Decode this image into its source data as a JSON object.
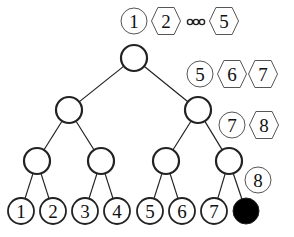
{
  "diagram": {
    "type": "complete-binary-tree",
    "levels": 4,
    "colors": {
      "stroke": "#222222",
      "annotation_stroke": "#555555",
      "filled_leaf": "#000000",
      "background": "#ffffff"
    },
    "tree_nodes": [
      {
        "id": "root",
        "x": 134,
        "y": 58,
        "level": 0
      },
      {
        "id": "l1-left",
        "x": 69,
        "y": 110,
        "level": 1
      },
      {
        "id": "l1-right",
        "x": 198,
        "y": 110,
        "level": 1
      },
      {
        "id": "l2-a",
        "x": 37,
        "y": 161,
        "level": 2
      },
      {
        "id": "l2-b",
        "x": 101,
        "y": 161,
        "level": 2
      },
      {
        "id": "l2-c",
        "x": 166,
        "y": 161,
        "level": 2
      },
      {
        "id": "l2-d",
        "x": 229,
        "y": 161,
        "level": 2
      }
    ],
    "edges": [
      [
        "root",
        "l1-left"
      ],
      [
        "root",
        "l1-right"
      ],
      [
        "l1-left",
        "l2-a"
      ],
      [
        "l1-left",
        "l2-b"
      ],
      [
        "l1-right",
        "l2-c"
      ],
      [
        "l1-right",
        "l2-d"
      ],
      [
        "l2-a",
        "leaf-1"
      ],
      [
        "l2-a",
        "leaf-2"
      ],
      [
        "l2-b",
        "leaf-3"
      ],
      [
        "l2-b",
        "leaf-4"
      ],
      [
        "l2-c",
        "leaf-5"
      ],
      [
        "l2-c",
        "leaf-6"
      ],
      [
        "l2-d",
        "leaf-7"
      ],
      [
        "l2-d",
        "leaf-8"
      ]
    ],
    "leaves": [
      {
        "id": "leaf-1",
        "label": "1",
        "x": 21,
        "y": 211,
        "filled": false
      },
      {
        "id": "leaf-2",
        "label": "2",
        "x": 53,
        "y": 211,
        "filled": false
      },
      {
        "id": "leaf-3",
        "label": "3",
        "x": 85,
        "y": 211,
        "filled": false
      },
      {
        "id": "leaf-4",
        "label": "4",
        "x": 117,
        "y": 211,
        "filled": false
      },
      {
        "id": "leaf-5",
        "label": "5",
        "x": 150,
        "y": 211,
        "filled": false
      },
      {
        "id": "leaf-6",
        "label": "6",
        "x": 182,
        "y": 211,
        "filled": false
      },
      {
        "id": "leaf-7",
        "label": "7",
        "x": 214,
        "y": 211,
        "filled": false
      },
      {
        "id": "leaf-8",
        "label": "",
        "x": 246,
        "y": 211,
        "filled": true
      }
    ],
    "annotations": [
      {
        "row": 1,
        "y": 21,
        "items": [
          {
            "shape": "circle",
            "label": "1",
            "x": 134
          },
          {
            "shape": "hexagon",
            "label": "2",
            "x": 166
          },
          {
            "shape": "ellipsis",
            "label": "ooo",
            "x": 196
          },
          {
            "shape": "hexagon",
            "label": "5",
            "x": 224
          }
        ]
      },
      {
        "row": 2,
        "y": 74,
        "items": [
          {
            "shape": "circle",
            "label": "5",
            "x": 200
          },
          {
            "shape": "hexagon",
            "label": "6",
            "x": 232
          },
          {
            "shape": "hexagon",
            "label": "7",
            "x": 263
          }
        ]
      },
      {
        "row": 3,
        "y": 125,
        "items": [
          {
            "shape": "circle",
            "label": "7",
            "x": 232
          },
          {
            "shape": "hexagon",
            "label": "8",
            "x": 264
          }
        ]
      },
      {
        "row": 4,
        "y": 180,
        "items": [
          {
            "shape": "circle",
            "label": "8",
            "x": 258
          }
        ]
      }
    ]
  }
}
